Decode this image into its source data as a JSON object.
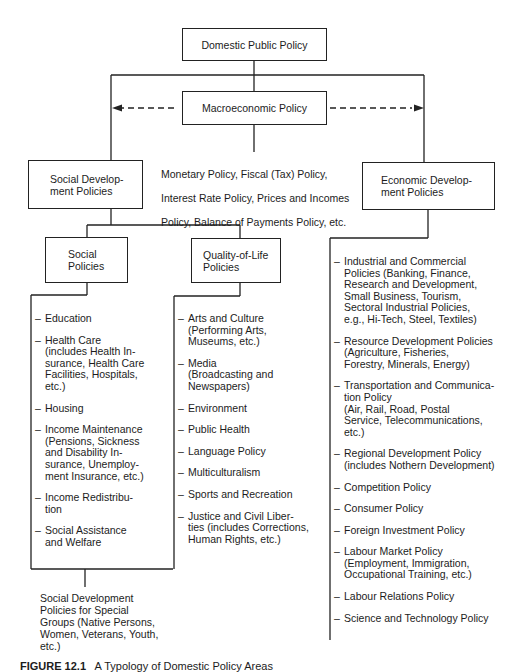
{
  "diagram": {
    "root": {
      "label": "Domestic Public Policy"
    },
    "macro": {
      "label": "Macroeconomic Policy",
      "description_lines": [
        "Monetary Policy, Fiscal (Tax) Policy,",
        "Interest Rate Policy, Prices and Incomes",
        "Policy, Balance of Payments Policy, etc."
      ]
    },
    "social_development": {
      "label_lines": [
        "Social Develop-",
        "ment Policies"
      ]
    },
    "economic_development": {
      "label_lines": [
        "Economic Develop-",
        "ment Policies"
      ]
    },
    "social_policies": {
      "label_lines": [
        "Social",
        "Policies"
      ],
      "items": [
        "Education",
        "Health Care\n(includes Health In-\nsurance, Health Care\nFacilities, Hospitals,\netc.)",
        "Housing",
        "Income Maintenance\n(Pensions, Sickness\nand Disability In-\nsurance, Unemploy-\nment Insurance, etc.)",
        "Income Redistribu-\ntion",
        "Social Assistance\nand Welfare"
      ]
    },
    "quality_of_life": {
      "label_lines": [
        "Quality-of-Life",
        "Policies"
      ],
      "items": [
        "Arts and Culture\n(Performing Arts,\nMuseums, etc.)",
        "Media\n(Broadcasting and\nNewspapers)",
        "Environment",
        "Public Health",
        "Language Policy",
        "Multiculturalism",
        "Sports and Recreation",
        "Justice and Civil Liber-\nties (includes Corrections,\nHuman Rights, etc.)"
      ]
    },
    "economic_items": [
      "Industrial and Commercial\nPolicies (Banking, Finance,\nResearch and Development,\nSmall Business, Tourism,\nSectoral Industrial Policies,\ne.g., Hi-Tech, Steel, Textiles)",
      "Resource Development Policies\n(Agriculture, Fisheries,\nForestry, Minerals, Energy)",
      "Transportation and Communica-\ntion Policy\n (Air, Rail, Road, Postal\n Service, Telecommunications,\n etc.)",
      "Regional Development Policy\n(includes Nothern Development)",
      "Competition Policy",
      "Consumer Policy",
      "Foreign Investment Policy",
      "Labour Market Policy\n(Employment, Immigration,\nOccupational Training, etc.)",
      "Labour Relations Policy",
      "Science and Technology Policy"
    ],
    "special_groups": {
      "text": "Social Development\nPolicies for Special\nGroups (Native Persons,\nWomen, Veterans, Youth,\netc.)"
    },
    "dash": "–",
    "line_color": "#222222"
  },
  "caption": {
    "figure_number": "FIGURE 12.1",
    "title": "A Typology of Domestic Policy Areas"
  }
}
